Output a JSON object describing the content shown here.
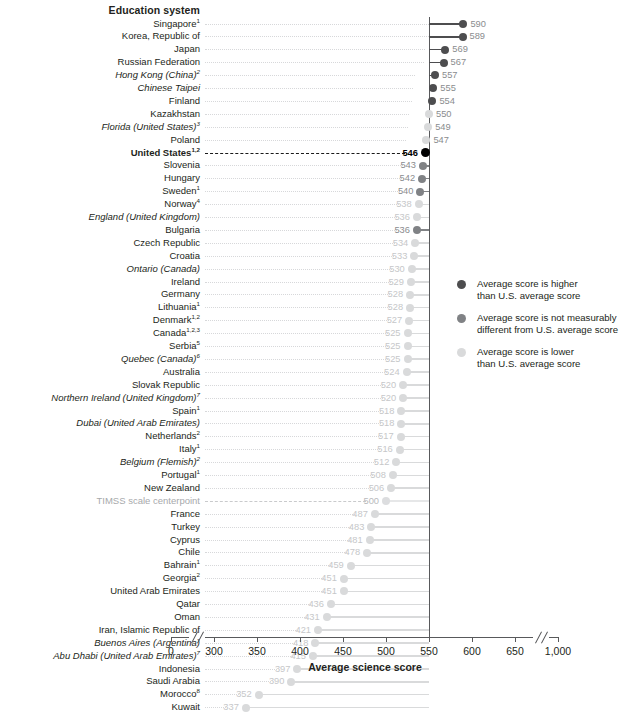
{
  "header": {
    "column_title": "Education system"
  },
  "axis": {
    "x_title": "Average science score",
    "ticks": [
      "0",
      "300",
      "350",
      "400",
      "450",
      "500",
      "550",
      "600",
      "650",
      "1,000"
    ],
    "tick_values": [
      0,
      300,
      350,
      400,
      450,
      500,
      550,
      600,
      650,
      1000
    ]
  },
  "legend": {
    "items": [
      {
        "key": "higher",
        "color": "#4d4d4f",
        "line1": "Average score is higher",
        "line2": "than U.S. average score"
      },
      {
        "key": "same",
        "color": "#808285",
        "line1": "Average score is not measurably",
        "line2": "different from U.S. average score"
      },
      {
        "key": "lower",
        "color": "#d9dadb",
        "line1": "Average score is lower",
        "line2": "than U.S. average score"
      }
    ]
  },
  "colors": {
    "higher": "#4d4d4f",
    "same": "#808285",
    "lower": "#d9dadb",
    "us": "#000000",
    "centerpoint": "#c9cacc",
    "axis": "#58595b",
    "leader": "#d7d8da"
  },
  "chart_data": {
    "type": "bar",
    "title": "Average science score",
    "xlabel": "Average science score",
    "ylabel": "Education system",
    "xlim": [
      280,
      560
    ],
    "reference_lines": [
      {
        "label": "United States",
        "value": 546
      },
      {
        "label": "TIMSS scale centerpoint",
        "value": 500
      }
    ],
    "categories": [
      "Singapore",
      "Korea, Republic of",
      "Japan",
      "Russian Federation",
      "Hong Kong (China)",
      "Chinese Taipei",
      "Finland",
      "Kazakhstan",
      "Florida (United States)",
      "Poland",
      "United States",
      "Slovenia",
      "Hungary",
      "Sweden",
      "Norway",
      "England (United Kingdom)",
      "Bulgaria",
      "Czech Republic",
      "Croatia",
      "Ontario (Canada)",
      "Ireland",
      "Germany",
      "Lithuania",
      "Denmark",
      "Canada",
      "Serbia",
      "Quebec (Canada)",
      "Australia",
      "Slovak Republic",
      "Northern Ireland (United Kingdom)",
      "Spain",
      "Dubai (United Arab Emirates)",
      "Netherlands",
      "Italy",
      "Belgium (Flemish)",
      "Portugal",
      "New Zealand",
      "TIMSS scale centerpoint",
      "France",
      "Turkey",
      "Cyprus",
      "Chile",
      "Bahrain",
      "Georgia",
      "United Arab Emirates",
      "Qatar",
      "Oman",
      "Iran, Islamic Republic of",
      "Buenos Aires (Argentina)",
      "Abu Dhabi (United Arab Emirates)",
      "Indonesia",
      "Saudi Arabia",
      "Morocco",
      "Kuwait"
    ],
    "values": [
      590,
      589,
      569,
      567,
      557,
      555,
      554,
      550,
      549,
      547,
      546,
      543,
      542,
      540,
      538,
      536,
      536,
      534,
      533,
      530,
      529,
      528,
      528,
      527,
      525,
      525,
      525,
      524,
      520,
      520,
      518,
      518,
      517,
      516,
      512,
      508,
      506,
      500,
      487,
      483,
      481,
      478,
      459,
      451,
      451,
      436,
      431,
      421,
      418,
      415,
      397,
      390,
      352,
      337
    ]
  },
  "rows": [
    {
      "label": "Singapore",
      "sup": "1",
      "value": 590,
      "group": "higher",
      "italic": false
    },
    {
      "label": "Korea, Republic of",
      "sup": "",
      "value": 589,
      "group": "higher",
      "italic": false
    },
    {
      "label": "Japan",
      "sup": "",
      "value": 569,
      "group": "higher",
      "italic": false
    },
    {
      "label": "Russian Federation",
      "sup": "",
      "value": 567,
      "group": "higher",
      "italic": false
    },
    {
      "label": "Hong Kong (China)",
      "sup": "2",
      "value": 557,
      "group": "higher",
      "italic": true
    },
    {
      "label": "Chinese Taipei",
      "sup": "",
      "value": 555,
      "group": "higher",
      "italic": true
    },
    {
      "label": "Finland",
      "sup": "",
      "value": 554,
      "group": "higher",
      "italic": false
    },
    {
      "label": "Kazakhstan",
      "sup": "",
      "value": 550,
      "group": "lower",
      "italic": false
    },
    {
      "label": "Florida (United States)",
      "sup": "3",
      "value": 549,
      "group": "lower",
      "italic": true
    },
    {
      "label": "Poland",
      "sup": "",
      "value": 547,
      "group": "lower",
      "italic": false
    },
    {
      "label": "United States",
      "sup": "1,2",
      "value": 546,
      "group": "us",
      "italic": false
    },
    {
      "label": "Slovenia",
      "sup": "",
      "value": 543,
      "group": "same",
      "italic": false
    },
    {
      "label": "Hungary",
      "sup": "",
      "value": 542,
      "group": "same",
      "italic": false
    },
    {
      "label": "Sweden",
      "sup": "1",
      "value": 540,
      "group": "same",
      "italic": false
    },
    {
      "label": "Norway",
      "sup": "4",
      "value": 538,
      "group": "lower",
      "italic": false
    },
    {
      "label": "England (United Kingdom)",
      "sup": "",
      "value": 536,
      "group": "lower",
      "italic": true
    },
    {
      "label": "Bulgaria",
      "sup": "",
      "value": 536,
      "group": "same",
      "italic": false
    },
    {
      "label": "Czech Republic",
      "sup": "",
      "value": 534,
      "group": "lower",
      "italic": false
    },
    {
      "label": "Croatia",
      "sup": "",
      "value": 533,
      "group": "lower",
      "italic": false
    },
    {
      "label": "Ontario (Canada)",
      "sup": "",
      "value": 530,
      "group": "lower",
      "italic": true
    },
    {
      "label": "Ireland",
      "sup": "",
      "value": 529,
      "group": "lower",
      "italic": false
    },
    {
      "label": "Germany",
      "sup": "",
      "value": 528,
      "group": "lower",
      "italic": false
    },
    {
      "label": "Lithuania",
      "sup": "1",
      "value": 528,
      "group": "lower",
      "italic": false
    },
    {
      "label": "Denmark",
      "sup": "1,2",
      "value": 527,
      "group": "lower",
      "italic": false
    },
    {
      "label": "Canada",
      "sup": "1,2,3",
      "value": 525,
      "group": "lower",
      "italic": false
    },
    {
      "label": "Serbia",
      "sup": "5",
      "value": 525,
      "group": "lower",
      "italic": false
    },
    {
      "label": "Quebec (Canada)",
      "sup": "6",
      "value": 525,
      "group": "lower",
      "italic": true
    },
    {
      "label": "Australia",
      "sup": "",
      "value": 524,
      "group": "lower",
      "italic": false
    },
    {
      "label": "Slovak Republic",
      "sup": "",
      "value": 520,
      "group": "lower",
      "italic": false
    },
    {
      "label": "Northern Ireland (United Kingdom)",
      "sup": "7",
      "value": 520,
      "group": "lower",
      "italic": true
    },
    {
      "label": "Spain",
      "sup": "1",
      "value": 518,
      "group": "lower",
      "italic": false
    },
    {
      "label": "Dubai (United Arab Emirates)",
      "sup": "",
      "value": 518,
      "group": "lower",
      "italic": true
    },
    {
      "label": "Netherlands",
      "sup": "2",
      "value": 517,
      "group": "lower",
      "italic": false
    },
    {
      "label": "Italy",
      "sup": "1",
      "value": 516,
      "group": "lower",
      "italic": false
    },
    {
      "label": "Belgium (Flemish)",
      "sup": "2",
      "value": 512,
      "group": "lower",
      "italic": true
    },
    {
      "label": "Portugal",
      "sup": "1",
      "value": 508,
      "group": "lower",
      "italic": false
    },
    {
      "label": "New Zealand",
      "sup": "",
      "value": 506,
      "group": "lower",
      "italic": false
    },
    {
      "label": "TIMSS scale centerpoint",
      "sup": "",
      "value": 500,
      "group": "centerpoint",
      "italic": false
    },
    {
      "label": "France",
      "sup": "",
      "value": 487,
      "group": "lower",
      "italic": false
    },
    {
      "label": "Turkey",
      "sup": "",
      "value": 483,
      "group": "lower",
      "italic": false
    },
    {
      "label": "Cyprus",
      "sup": "",
      "value": 481,
      "group": "lower",
      "italic": false
    },
    {
      "label": "Chile",
      "sup": "",
      "value": 478,
      "group": "lower",
      "italic": false
    },
    {
      "label": "Bahrain",
      "sup": "1",
      "value": 459,
      "group": "lower",
      "italic": false
    },
    {
      "label": "Georgia",
      "sup": "2",
      "value": 451,
      "group": "lower",
      "italic": false
    },
    {
      "label": "United Arab Emirates",
      "sup": "",
      "value": 451,
      "group": "lower",
      "italic": false
    },
    {
      "label": "Qatar",
      "sup": "",
      "value": 436,
      "group": "lower",
      "italic": false
    },
    {
      "label": "Oman",
      "sup": "",
      "value": 431,
      "group": "lower",
      "italic": false
    },
    {
      "label": "Iran, Islamic Republic of",
      "sup": "",
      "value": 421,
      "group": "lower",
      "italic": false
    },
    {
      "label": "Buenos Aires (Argentina)",
      "sup": "",
      "value": 418,
      "group": "lower",
      "italic": true
    },
    {
      "label": "Abu Dhabi (United Arab Emirates)",
      "sup": "7",
      "value": 415,
      "group": "lower",
      "italic": true
    },
    {
      "label": "Indonesia",
      "sup": "",
      "value": 397,
      "group": "lower",
      "italic": false
    },
    {
      "label": "Saudi Arabia",
      "sup": "",
      "value": 390,
      "group": "lower",
      "italic": false
    },
    {
      "label": "Morocco",
      "sup": "8",
      "value": 352,
      "group": "lower",
      "italic": false
    },
    {
      "label": "Kuwait",
      "sup": "",
      "value": 337,
      "group": "lower",
      "italic": false
    }
  ]
}
